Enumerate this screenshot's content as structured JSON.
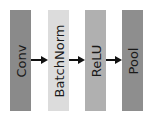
{
  "diagram": {
    "type": "layer-pipeline",
    "direction": "left-to-right",
    "blocks": [
      {
        "id": "conv",
        "label": "Conv",
        "color": "#8a8a8a",
        "x": 10
      },
      {
        "id": "batchnorm",
        "label": "BatchNorm",
        "color": "#dcdcdc",
        "x": 48
      },
      {
        "id": "relu",
        "label": "ReLU",
        "color": "#b0b0b0",
        "x": 85
      },
      {
        "id": "pool",
        "label": "Pool",
        "color": "#8e8e8e",
        "x": 122
      }
    ],
    "edges": [
      {
        "from": "conv",
        "to": "batchnorm"
      },
      {
        "from": "batchnorm",
        "to": "relu"
      },
      {
        "from": "relu",
        "to": "pool"
      }
    ],
    "arrow_color": "#111111",
    "text_color": "#1a1a1a"
  }
}
